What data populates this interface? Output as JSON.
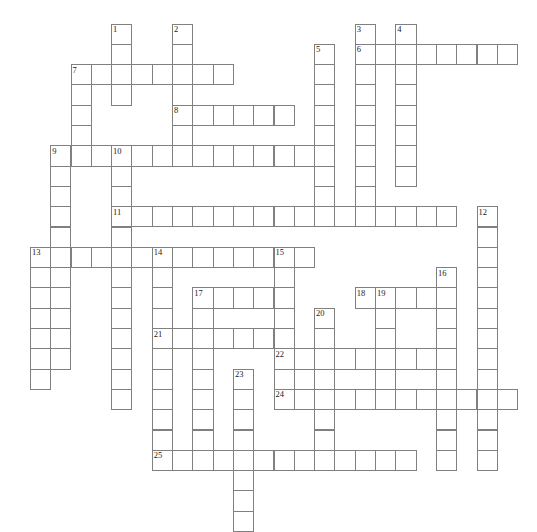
{
  "puzzle": {
    "title": "Crossword Puzzle Grid",
    "type": "crossword",
    "grid": {
      "cell_size": 20.3,
      "origin_x": 9.6,
      "origin_y": 23.5,
      "border_color": "#808080",
      "background_color": "#ffffff",
      "number_color": "#1a1a1a"
    },
    "entries": [
      {
        "number": "1",
        "direction": "down",
        "col": 5,
        "row": 0,
        "length": 4
      },
      {
        "number": "2",
        "direction": "down",
        "col": 8,
        "row": 0,
        "length": 6
      },
      {
        "number": "3",
        "direction": "down",
        "col": 17,
        "row": 0,
        "length": 10
      },
      {
        "number": "4",
        "direction": "down",
        "col": 19,
        "row": 0,
        "length": 8
      },
      {
        "number": "5",
        "direction": "down",
        "col": 15,
        "row": 1,
        "length": 9
      },
      {
        "number": "6",
        "direction": "across",
        "col": 17,
        "row": 1,
        "length": 8
      },
      {
        "number": "7",
        "direction": "across",
        "col": 3,
        "row": 2,
        "length": 8
      },
      {
        "number": "7",
        "direction": "down",
        "col": 3,
        "row": 2,
        "length": 5
      },
      {
        "number": "8",
        "direction": "across",
        "col": 8,
        "row": 4,
        "length": 6
      },
      {
        "number": "9",
        "direction": "across",
        "col": 2,
        "row": 6,
        "length": 14
      },
      {
        "number": "9",
        "direction": "down",
        "col": 2,
        "row": 6,
        "length": 11
      },
      {
        "number": "10",
        "direction": "down",
        "col": 5,
        "row": 6,
        "length": 13
      },
      {
        "number": "11",
        "direction": "across",
        "col": 5,
        "row": 9,
        "length": 17
      },
      {
        "number": "12",
        "direction": "down",
        "col": 23,
        "row": 9,
        "length": 13
      },
      {
        "number": "13",
        "direction": "across",
        "col": 1,
        "row": 11,
        "length": 14
      },
      {
        "number": "13",
        "direction": "down",
        "col": 1,
        "row": 11,
        "length": 7
      },
      {
        "number": "14",
        "direction": "across",
        "col": 7,
        "row": 11,
        "length": 8
      },
      {
        "number": "14",
        "direction": "down",
        "col": 7,
        "row": 11,
        "length": 10
      },
      {
        "number": "15",
        "direction": "down",
        "col": 13,
        "row": 11,
        "length": 7
      },
      {
        "number": "16",
        "direction": "down",
        "col": 21,
        "row": 12,
        "length": 10
      },
      {
        "number": "17",
        "direction": "across",
        "col": 9,
        "row": 13,
        "length": 5
      },
      {
        "number": "17",
        "direction": "down",
        "col": 9,
        "row": 13,
        "length": 9
      },
      {
        "number": "18",
        "direction": "across",
        "col": 17,
        "row": 13,
        "length": 5
      },
      {
        "number": "19",
        "direction": "down",
        "col": 18,
        "row": 13,
        "length": 5
      },
      {
        "number": "20",
        "direction": "down",
        "col": 15,
        "row": 14,
        "length": 8
      },
      {
        "number": "21",
        "direction": "across",
        "col": 7,
        "row": 15,
        "length": 6
      },
      {
        "number": "22",
        "direction": "across",
        "col": 13,
        "row": 16,
        "length": 8
      },
      {
        "number": "23",
        "direction": "down",
        "col": 11,
        "row": 17,
        "length": 8
      },
      {
        "number": "24",
        "direction": "across",
        "col": 13,
        "row": 18,
        "length": 12
      },
      {
        "number": "25",
        "direction": "across",
        "col": 7,
        "row": 21,
        "length": 13
      }
    ],
    "numbers_visible": [
      "1",
      "2",
      "3",
      "4",
      "5",
      "6",
      "7",
      "8",
      "9",
      "10",
      "11",
      "12",
      "13",
      "14",
      "15",
      "16",
      "17",
      "18",
      "19",
      "20",
      "21",
      "22",
      "23",
      "24",
      "25"
    ]
  }
}
